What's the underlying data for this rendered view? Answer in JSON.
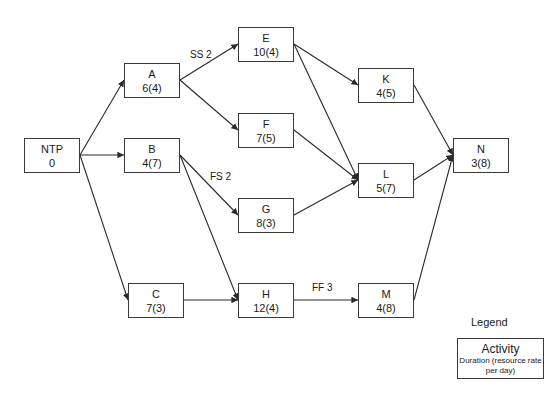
{
  "diagram": {
    "type": "precedence network (activity-on-node)",
    "nodes": [
      {
        "id": "NTP",
        "label": "NTP",
        "value": "0",
        "x": 24,
        "y": 138,
        "w": 56,
        "h": 35
      },
      {
        "id": "A",
        "label": "A",
        "value": "6(4)",
        "x": 124,
        "y": 63,
        "w": 56,
        "h": 35
      },
      {
        "id": "B",
        "label": "B",
        "value": "4(7)",
        "x": 124,
        "y": 138,
        "w": 56,
        "h": 35
      },
      {
        "id": "C",
        "label": "C",
        "value": "7(3)",
        "x": 128,
        "y": 283,
        "w": 56,
        "h": 35
      },
      {
        "id": "E",
        "label": "E",
        "value": "10(4)",
        "x": 238,
        "y": 27,
        "w": 56,
        "h": 35
      },
      {
        "id": "F",
        "label": "F",
        "value": "7(5)",
        "x": 238,
        "y": 113,
        "w": 56,
        "h": 35
      },
      {
        "id": "G",
        "label": "G",
        "value": "8(3)",
        "x": 238,
        "y": 198,
        "w": 56,
        "h": 35
      },
      {
        "id": "H",
        "label": "H",
        "value": "12(4)",
        "x": 238,
        "y": 283,
        "w": 56,
        "h": 35
      },
      {
        "id": "K",
        "label": "K",
        "value": "4(5)",
        "x": 358,
        "y": 68,
        "w": 56,
        "h": 35
      },
      {
        "id": "L",
        "label": "L",
        "value": "5(7)",
        "x": 358,
        "y": 163,
        "w": 56,
        "h": 35
      },
      {
        "id": "M",
        "label": "M",
        "value": "4(8)",
        "x": 358,
        "y": 283,
        "w": 56,
        "h": 35
      },
      {
        "id": "N",
        "label": "N",
        "value": "3(8)",
        "x": 453,
        "y": 138,
        "w": 56,
        "h": 35
      }
    ],
    "edges": [
      {
        "from": "NTP",
        "to": "A",
        "x1": 80,
        "y1": 155,
        "x2": 124,
        "y2": 80
      },
      {
        "from": "NTP",
        "to": "B",
        "x1": 80,
        "y1": 155,
        "x2": 124,
        "y2": 155
      },
      {
        "from": "NTP",
        "to": "C",
        "x1": 80,
        "y1": 155,
        "x2": 128,
        "y2": 300
      },
      {
        "from": "A",
        "to": "E",
        "x1": 180,
        "y1": 80,
        "x2": 238,
        "y2": 44,
        "lag": "SS 2"
      },
      {
        "from": "A",
        "to": "F",
        "x1": 180,
        "y1": 80,
        "x2": 238,
        "y2": 130
      },
      {
        "from": "B",
        "to": "G",
        "x1": 180,
        "y1": 155,
        "x2": 238,
        "y2": 215,
        "lag": "FS 2"
      },
      {
        "from": "B",
        "to": "H",
        "x1": 180,
        "y1": 155,
        "x2": 238,
        "y2": 300
      },
      {
        "from": "C",
        "to": "H",
        "x1": 184,
        "y1": 300,
        "x2": 238,
        "y2": 300
      },
      {
        "from": "E",
        "to": "K",
        "x1": 294,
        "y1": 44,
        "x2": 358,
        "y2": 85
      },
      {
        "from": "E",
        "to": "L",
        "x1": 294,
        "y1": 44,
        "x2": 358,
        "y2": 180
      },
      {
        "from": "F",
        "to": "L",
        "x1": 294,
        "y1": 130,
        "x2": 358,
        "y2": 180
      },
      {
        "from": "G",
        "to": "L",
        "x1": 294,
        "y1": 215,
        "x2": 358,
        "y2": 180
      },
      {
        "from": "H",
        "to": "M",
        "x1": 294,
        "y1": 300,
        "x2": 358,
        "y2": 300,
        "lag": "FF 3"
      },
      {
        "from": "K",
        "to": "N",
        "x1": 414,
        "y1": 85,
        "x2": 453,
        "y2": 155
      },
      {
        "from": "L",
        "to": "N",
        "x1": 414,
        "y1": 180,
        "x2": 453,
        "y2": 155
      },
      {
        "from": "M",
        "to": "N",
        "x1": 414,
        "y1": 300,
        "x2": 453,
        "y2": 155
      }
    ],
    "lag_labels": [
      {
        "text": "SS 2",
        "x": 190,
        "y": 49
      },
      {
        "text": "FS 2",
        "x": 210,
        "y": 171
      },
      {
        "text": "FF 3",
        "x": 312,
        "y": 282
      }
    ],
    "legend": {
      "title": "Legend",
      "box_title": "Activity",
      "box_desc": "Duration (resource rate per day)"
    },
    "colors": {
      "line": "#2a2a2a",
      "border": "#3a3a3a",
      "text": "#1a1a1a",
      "background": "#ffffff"
    }
  }
}
